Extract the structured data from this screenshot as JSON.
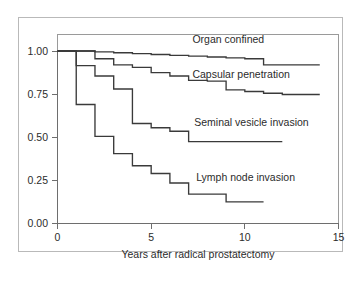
{
  "figure": {
    "name": "kaplan-meier-survival-figure",
    "background_color": "#ffffff",
    "frame_color": "#b9b9b9",
    "plot_border_color": "#9a9a9a",
    "curve_color": "#3a3a3a",
    "text_color": "#2b2b2b"
  },
  "chart_data": {
    "type": "line",
    "title": "",
    "subtitle": "",
    "xlabel": "Years after radical prostatectomy",
    "ylabel": "",
    "xlim": [
      0,
      15
    ],
    "ylim": [
      0,
      1.0
    ],
    "xticks": [
      0,
      5,
      10,
      15
    ],
    "xtick_labels": [
      "0",
      "5",
      "10",
      "15"
    ],
    "yticks": [
      0.0,
      0.25,
      0.5,
      0.75,
      1.0
    ],
    "ytick_labels": [
      "0.00",
      "0.25",
      "0.50",
      "0.75",
      "1.00"
    ],
    "grid": false,
    "legend_position": "inline-right",
    "step_shape": "post",
    "series": [
      {
        "name": "Organ confined",
        "label": "Organ confined",
        "label_x": 7.2,
        "label_y": 1.045,
        "x": [
          0,
          1,
          2,
          3,
          4,
          5,
          6,
          7,
          8,
          9,
          10,
          11,
          14
        ],
        "y": [
          1.0,
          1.0,
          0.995,
          0.99,
          0.985,
          0.98,
          0.975,
          0.97,
          0.965,
          0.96,
          0.955,
          0.92,
          0.92
        ]
      },
      {
        "name": "Capsular penetration",
        "label": "Capsular penetration",
        "label_x": 7.2,
        "label_y": 0.845,
        "x": [
          0,
          1,
          2,
          3,
          4,
          5,
          6,
          7,
          8,
          9,
          10,
          11,
          12,
          14
        ],
        "y": [
          1.0,
          1.0,
          0.955,
          0.92,
          0.905,
          0.875,
          0.855,
          0.83,
          0.825,
          0.775,
          0.765,
          0.755,
          0.748,
          0.748
        ]
      },
      {
        "name": "Seminal vesicle invasion",
        "label": "Seminal vesicle invasion",
        "label_x": 7.3,
        "label_y": 0.565,
        "x": [
          0,
          1,
          2,
          3,
          4,
          5,
          6,
          7,
          12
        ],
        "y": [
          1.0,
          0.915,
          0.855,
          0.78,
          0.58,
          0.555,
          0.535,
          0.475,
          0.475
        ]
      },
      {
        "name": "Lymph node invasion",
        "label": "Lymph node invasion",
        "label_x": 7.4,
        "label_y": 0.245,
        "x": [
          0,
          1,
          2,
          3,
          4,
          5,
          6,
          7,
          9,
          11
        ],
        "y": [
          1.0,
          0.69,
          0.505,
          0.405,
          0.335,
          0.29,
          0.235,
          0.17,
          0.125,
          0.125
        ]
      }
    ]
  }
}
